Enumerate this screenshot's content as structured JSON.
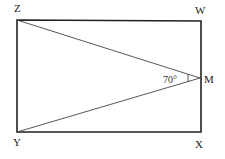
{
  "diagram": {
    "type": "geometry",
    "shape": "rectangle",
    "vertices": [
      {
        "name": "Z",
        "x": 17,
        "y": 20
      },
      {
        "name": "W",
        "x": 201,
        "y": 21
      },
      {
        "name": "X",
        "x": 201,
        "y": 132
      },
      {
        "name": "Y",
        "x": 17,
        "y": 132
      }
    ],
    "point_M": {
      "name": "M",
      "x": 200,
      "y": 78
    },
    "labels": {
      "Z": "Z",
      "W": "W",
      "X": "X",
      "Y": "Y",
      "M": "M",
      "angle": "70°"
    },
    "segments": [
      "ZW",
      "WX",
      "XY",
      "YZ",
      "ZM",
      "YM"
    ],
    "angle_marked": "ZMY",
    "angle_value": "70°",
    "colors": {
      "stroke": "#222222",
      "background": "#ffffff"
    }
  }
}
